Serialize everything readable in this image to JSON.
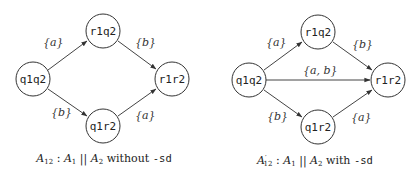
{
  "diagrams": [
    {
      "id": "left",
      "nodes": [
        {
          "id": "q1q2",
          "label": "q1q2",
          "cx": 33,
          "cy": 79
        },
        {
          "id": "r1q2",
          "label": "r1q2",
          "cx": 103,
          "cy": 31
        },
        {
          "id": "q1r2",
          "label": "q1r2",
          "cx": 103,
          "cy": 126
        },
        {
          "id": "r1r2",
          "label": "r1r2",
          "cx": 172,
          "cy": 79
        }
      ],
      "edges": [
        {
          "from": "q1q2",
          "to": "r1q2",
          "label": "{a}"
        },
        {
          "from": "q1q2",
          "to": "q1r2",
          "label": "{b}"
        },
        {
          "from": "r1q2",
          "to": "r1r2",
          "label": "{b}"
        },
        {
          "from": "q1r2",
          "to": "r1r2",
          "label": "{a}"
        }
      ],
      "caption": {
        "automaton": "A",
        "automaton_sub": "12",
        "sep": ":",
        "left": "A",
        "left_sub": "1",
        "op": "||",
        "right": "A",
        "right_sub": "2",
        "text": "without",
        "flag": "-sd"
      }
    },
    {
      "id": "right",
      "nodes": [
        {
          "id": "q1q2",
          "label": "q1q2",
          "cx": 249,
          "cy": 80
        },
        {
          "id": "r1q2",
          "label": "r1q2",
          "cx": 318,
          "cy": 32
        },
        {
          "id": "q1r2",
          "label": "q1r2",
          "cx": 318,
          "cy": 127
        },
        {
          "id": "r1r2",
          "label": "r1r2",
          "cx": 388,
          "cy": 80
        }
      ],
      "edges": [
        {
          "from": "q1q2",
          "to": "r1q2",
          "label": "{a}"
        },
        {
          "from": "q1q2",
          "to": "q1r2",
          "label": "{b}"
        },
        {
          "from": "q1q2",
          "to": "r1r2",
          "label": "{a, b}"
        },
        {
          "from": "r1q2",
          "to": "r1r2",
          "label": "{b}"
        },
        {
          "from": "q1r2",
          "to": "r1r2",
          "label": "{a}"
        }
      ],
      "caption": {
        "automaton": "A",
        "automaton_prime": "′",
        "automaton_sub": "12",
        "sep": ":",
        "left": "A",
        "left_sub": "1",
        "op": "||",
        "right": "A",
        "right_sub": "2",
        "text": "with",
        "flag": "-sd"
      }
    }
  ]
}
